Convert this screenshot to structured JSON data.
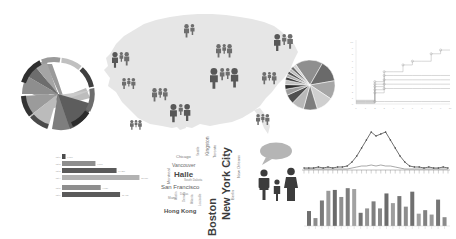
{
  "page": {
    "background": "#ffffff"
  },
  "palette": {
    "map_fill": "#e4e4e4",
    "icon_dark": "#585858",
    "icon_mid": "#6e6e6e",
    "bar_dark": "#5a5a5a",
    "bar_mid": "#8a8a8a",
    "bar_light": "#b4b4b4",
    "line_gray": "#9b9b9b",
    "ring_dark": "#3c3c3c",
    "ring_mid": "#8c8c8c",
    "ring_light": "#c3c3c3"
  },
  "chord": {
    "name": "Chord Diagram",
    "arcs": [
      {
        "label": "A",
        "start": 182,
        "end": 238,
        "color": "#8e8e8e"
      },
      {
        "label": "B",
        "start": 240,
        "end": 262,
        "color": "#3f3f3f"
      },
      {
        "label": "C",
        "start": 264,
        "end": 300,
        "color": "#a5a5a5"
      },
      {
        "label": "D",
        "start": 302,
        "end": 330,
        "color": "#6d6d6d"
      },
      {
        "label": "E",
        "start": 332,
        "end": 12,
        "color": "#2f2f2f"
      },
      {
        "label": "F",
        "start": 14,
        "end": 56,
        "color": "#c0c0c0"
      },
      {
        "label": "G",
        "start": 58,
        "end": 96,
        "color": "#777777"
      },
      {
        "label": "H",
        "start": 98,
        "end": 134,
        "color": "#4a4a4a"
      },
      {
        "label": "I",
        "start": 136,
        "end": 180,
        "color": "#9c9c9c"
      }
    ],
    "ribbons": [
      {
        "from": "A",
        "to": "E",
        "color": "#a8a8a8"
      },
      {
        "from": "C",
        "to": "G",
        "color": "#8a8a8a"
      },
      {
        "from": "D",
        "to": "H",
        "color": "#6a6a6a"
      },
      {
        "from": "B",
        "to": "F",
        "color": "#bdbdbd"
      },
      {
        "from": "I",
        "to": "D",
        "color": "#5c5c5c"
      }
    ]
  },
  "map": {
    "name": "United States Population Map",
    "region_label": "United States",
    "icon_groups": [
      {
        "region": "pacific-northwest",
        "x": 16,
        "y": 46,
        "sizes": [
          13,
          8,
          11
        ]
      },
      {
        "region": "northern-plains",
        "x": 88,
        "y": 18,
        "sizes": [
          11,
          9
        ]
      },
      {
        "region": "great-lakes",
        "x": 120,
        "y": 38,
        "sizes": [
          11,
          8,
          11
        ]
      },
      {
        "region": "northeast",
        "x": 178,
        "y": 28,
        "sizes": [
          14,
          9,
          12
        ]
      },
      {
        "region": "california",
        "x": 26,
        "y": 72,
        "sizes": [
          9,
          7,
          9
        ]
      },
      {
        "region": "mountain",
        "x": 56,
        "y": 82,
        "sizes": [
          11,
          8,
          10
        ]
      },
      {
        "region": "midwest",
        "x": 114,
        "y": 62,
        "sizes": [
          17,
          10,
          9,
          16
        ]
      },
      {
        "region": "mid-atlantic",
        "x": 166,
        "y": 66,
        "sizes": [
          10,
          7,
          10
        ]
      },
      {
        "region": "texas",
        "x": 74,
        "y": 98,
        "sizes": [
          15,
          9,
          14
        ]
      },
      {
        "region": "southeast",
        "x": 160,
        "y": 108,
        "sizes": [
          9,
          7,
          9
        ]
      },
      {
        "region": "southwest",
        "x": 34,
        "y": 114,
        "sizes": [
          8,
          6,
          8
        ]
      }
    ]
  },
  "pie": {
    "name": "Pie Chart",
    "slices": [
      {
        "label": "slice-1",
        "value": 18,
        "color": "#8f8f8f"
      },
      {
        "label": "slice-2",
        "value": 14,
        "color": "#6a6a6a"
      },
      {
        "label": "slice-3",
        "value": 12,
        "color": "#a6a6a6"
      },
      {
        "label": "slice-4",
        "value": 11,
        "color": "#cfcfcf"
      },
      {
        "label": "slice-5",
        "value": 9,
        "color": "#7d7d7d"
      },
      {
        "label": "slice-6",
        "value": 8,
        "color": "#b8b8b8"
      },
      {
        "label": "slice-7",
        "value": 6,
        "color": "#4f4f4f"
      },
      {
        "label": "slice-8",
        "value": 4,
        "color": "#9c9c9c"
      },
      {
        "label": "slice-9",
        "value": 3,
        "color": "#2f2f2f"
      },
      {
        "label": "slice-10",
        "value": 3,
        "color": "#c2c2c2"
      },
      {
        "label": "slice-11",
        "value": 2,
        "color": "#3a3a3a"
      },
      {
        "label": "slice-12",
        "value": 2,
        "color": "#ababab"
      },
      {
        "label": "slice-13",
        "value": 2,
        "color": "#555555"
      },
      {
        "label": "slice-14",
        "value": 2,
        "color": "#bdbdbd"
      },
      {
        "label": "slice-15",
        "value": 2,
        "color": "#6f6f6f"
      },
      {
        "label": "slice-16",
        "value": 2,
        "color": "#d2d2d2"
      }
    ]
  },
  "chart_data": [
    {
      "type": "line",
      "name": "step-line-chart",
      "title": "",
      "xlabel": "",
      "ylabel": "",
      "xlim": [
        0,
        10
      ],
      "ylim": [
        0,
        10
      ],
      "grid": false,
      "x": [
        0,
        1,
        2,
        3,
        4,
        5,
        6,
        7,
        8,
        9,
        10
      ],
      "series": [
        {
          "name": "series-1",
          "values": [
            0.6,
            0.6,
            3.6,
            5.2,
            5.2,
            6.3,
            6.9,
            6.9,
            8.1,
            8.7,
            8.7
          ]
        },
        {
          "name": "series-2",
          "values": [
            0.5,
            0.5,
            3.2,
            4.6,
            4.6,
            4.6,
            4.6,
            4.6,
            4.6,
            4.6,
            4.6
          ]
        },
        {
          "name": "series-3",
          "values": [
            0.4,
            0.4,
            2.8,
            3.9,
            3.9,
            3.9,
            3.9,
            3.9,
            3.9,
            3.9,
            3.9
          ]
        },
        {
          "name": "series-4",
          "values": [
            0.3,
            0.3,
            2.3,
            3.2,
            3.2,
            3.2,
            3.2,
            3.2,
            3.2,
            3.2,
            3.2
          ]
        },
        {
          "name": "series-5",
          "values": [
            0.2,
            0.2,
            1.8,
            2.5,
            2.5,
            2.5,
            2.5,
            2.5,
            2.5,
            2.5,
            2.5
          ]
        },
        {
          "name": "series-6",
          "values": [
            0.1,
            0.1,
            0.4,
            0.4,
            0.4,
            0.4,
            0.4,
            0.4,
            0.4,
            0.4,
            0.4
          ]
        }
      ],
      "ytick_labels": [
        "10",
        "9",
        "8",
        "7",
        "6",
        "5",
        "4",
        "3",
        "2",
        "1",
        "0"
      ],
      "xtick_labels": [
        "0",
        "1",
        "2",
        "3",
        "4",
        "5",
        "6",
        "7",
        "8",
        "9",
        "10"
      ]
    },
    {
      "type": "bar",
      "name": "horizontal-bar-chart",
      "orientation": "horizontal",
      "title": "",
      "categories": [
        "cat-1",
        "cat-2",
        "cat-3",
        "cat-4",
        "cat-5",
        "cat-6"
      ],
      "values": [
        4,
        38,
        62,
        88,
        44,
        66
      ],
      "value_labels": [
        "1,240",
        "7,860",
        "14,310",
        "21,950",
        "9,120",
        "16,480"
      ],
      "colors": [
        "#4c4c4c",
        "#8e8e8e",
        "#5a5a5a",
        "#b2b2b2",
        "#8e8e8e",
        "#5a5a5a"
      ],
      "xlim": [
        0,
        100
      ],
      "grid": false
    },
    {
      "type": "line",
      "name": "distribution-curve-chart",
      "title": "",
      "xlabel": "",
      "ylabel": "",
      "grid": false,
      "x": [
        0,
        1,
        2,
        3,
        4,
        5,
        6,
        7,
        8,
        9,
        10,
        11,
        12,
        13,
        14,
        15,
        16,
        17,
        18,
        19,
        20,
        21,
        22,
        23,
        24,
        25,
        26,
        27,
        28,
        29,
        30
      ],
      "series": [
        {
          "name": "primary",
          "values": [
            2,
            2,
            2,
            3,
            2,
            3,
            2,
            3,
            3,
            4,
            8,
            14,
            22,
            30,
            38,
            34,
            36,
            38,
            30,
            22,
            14,
            8,
            4,
            3,
            3,
            2,
            3,
            2,
            2,
            3,
            2
          ]
        },
        {
          "name": "baseline",
          "values": [
            1,
            1,
            1,
            1,
            1,
            1,
            1,
            1,
            1,
            1,
            2,
            3,
            4,
            4,
            5,
            4,
            5,
            4,
            4,
            3,
            2,
            1,
            1,
            1,
            1,
            1,
            1,
            1,
            1,
            1,
            1
          ]
        }
      ],
      "ylim": [
        0,
        42
      ]
    },
    {
      "type": "bar",
      "name": "vertical-bar-chart",
      "orientation": "vertical",
      "title": "",
      "categories": [
        "1",
        "2",
        "3",
        "4",
        "5",
        "6",
        "7",
        "8",
        "9",
        "10",
        "11",
        "12",
        "13",
        "14",
        "15",
        "16",
        "17",
        "18",
        "19",
        "20",
        "21",
        "22"
      ],
      "values": [
        34,
        18,
        58,
        80,
        82,
        66,
        86,
        84,
        30,
        40,
        56,
        40,
        74,
        52,
        68,
        44,
        78,
        28,
        36,
        26,
        60,
        20
      ],
      "colors": [
        "#6f6f6f",
        "#8c8c8c",
        "#7a7a7a",
        "#9a9a9a",
        "#6a6a6a",
        "#8f8f8f",
        "#7d7d7d",
        "#a2a2a2",
        "#737373",
        "#949494",
        "#7f7f7f",
        "#8a8a8a",
        "#6c6c6c",
        "#9e9e9e",
        "#777777",
        "#8d8d8d",
        "#707070",
        "#a0a0a0",
        "#828282",
        "#999999",
        "#757575",
        "#8b8b8b"
      ],
      "ylim": [
        0,
        100
      ],
      "grid": false
    }
  ],
  "wordcloud": {
    "name": "City Word Cloud",
    "words": [
      {
        "text": "New York City",
        "size": 11,
        "weight": "bold",
        "color": "#3a3a3a",
        "rotate": -90,
        "x": 60,
        "y": 94
      },
      {
        "text": "Boston",
        "size": 11,
        "weight": "bold",
        "color": "#3d3d3d",
        "rotate": -90,
        "x": 46,
        "y": 110
      },
      {
        "text": "Halle",
        "size": 8,
        "weight": "bold",
        "color": "#4a4a4a",
        "rotate": 0,
        "x": 14,
        "y": 44
      },
      {
        "text": "San Francisco",
        "size": 6,
        "weight": "normal",
        "color": "#5a5a5a",
        "rotate": 0,
        "x": 1,
        "y": 58
      },
      {
        "text": "Hong Kong",
        "size": 6,
        "weight": "bold",
        "color": "#4f4f4f",
        "rotate": 0,
        "x": 4,
        "y": 82
      },
      {
        "text": "Vancouver",
        "size": 5,
        "weight": "normal",
        "color": "#6a6a6a",
        "rotate": 0,
        "x": 12,
        "y": 36
      },
      {
        "text": "Kingston",
        "size": 5,
        "weight": "normal",
        "color": "#6e6e6e",
        "rotate": -90,
        "x": 44,
        "y": 30
      },
      {
        "text": "Chicago",
        "size": 4,
        "weight": "normal",
        "color": "#777777",
        "rotate": 0,
        "x": 16,
        "y": 28
      },
      {
        "text": "Montreal",
        "size": 4,
        "weight": "normal",
        "color": "#7a7a7a",
        "rotate": -90,
        "x": 6,
        "y": 58
      },
      {
        "text": "Toronto",
        "size": 4,
        "weight": "normal",
        "color": "#7d7d7d",
        "rotate": -90,
        "x": 52,
        "y": 32
      },
      {
        "text": "New Orleans",
        "size": 4,
        "weight": "normal",
        "color": "#7b7b7b",
        "rotate": -90,
        "x": 76,
        "y": 52
      },
      {
        "text": "Berlin",
        "size": 4,
        "weight": "normal",
        "color": "#808080",
        "rotate": -90,
        "x": 70,
        "y": 74
      },
      {
        "text": "South Dakota",
        "size": 3,
        "weight": "normal",
        "color": "#8a8a8a",
        "rotate": 0,
        "x": 24,
        "y": 52
      },
      {
        "text": "Seattle",
        "size": 3,
        "weight": "normal",
        "color": "#8c8c8c",
        "rotate": -90,
        "x": 36,
        "y": 30
      },
      {
        "text": "Austin",
        "size": 3,
        "weight": "normal",
        "color": "#8e8e8e",
        "rotate": -90,
        "x": 14,
        "y": 74
      },
      {
        "text": "Denver",
        "size": 3,
        "weight": "normal",
        "color": "#909090",
        "rotate": -90,
        "x": 22,
        "y": 76
      },
      {
        "text": "Atlanta",
        "size": 3,
        "weight": "normal",
        "color": "#8f8f8f",
        "rotate": -90,
        "x": 30,
        "y": 78
      },
      {
        "text": "Louisville",
        "size": 3,
        "weight": "normal",
        "color": "#939393",
        "rotate": -90,
        "x": 38,
        "y": 80
      },
      {
        "text": "Portland",
        "size": 3,
        "weight": "normal",
        "color": "#949494",
        "rotate": -90,
        "x": 66,
        "y": 40
      },
      {
        "text": "Miami",
        "size": 3,
        "weight": "normal",
        "color": "#8b8b8b",
        "rotate": 0,
        "x": 8,
        "y": 70
      },
      {
        "text": "Dallas",
        "size": 3,
        "weight": "normal",
        "color": "#909090",
        "rotate": 0,
        "x": 20,
        "y": 66
      }
    ]
  },
  "bubble_family": {
    "name": "Speech Bubble With Family",
    "bubble_color": "#b5b5b5",
    "figures": [
      {
        "role": "adult-male",
        "height": 26,
        "color": "#3c3c3c"
      },
      {
        "role": "child",
        "height": 15,
        "color": "#3c3c3c"
      },
      {
        "role": "adult-female",
        "height": 28,
        "color": "#3c3c3c"
      }
    ]
  }
}
